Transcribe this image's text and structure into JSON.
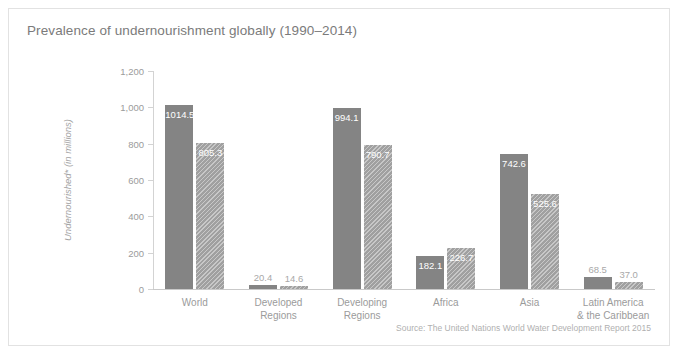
{
  "chart_data": {
    "type": "bar",
    "title": "Prevalence of undernourishment globally (1990–2014)",
    "xlabel": "",
    "ylabel": "Undernourished* (in millions)",
    "ylim": [
      0,
      1200
    ],
    "yticks": [
      "0",
      "200",
      "400",
      "600",
      "800",
      "1,000",
      "1,200"
    ],
    "grid": false,
    "legend": "none",
    "categories": [
      "World",
      "Developed Regions",
      "Developing Regions",
      "Africa",
      "Asia",
      "Latin America & the Caribbean"
    ],
    "category_lines": [
      [
        "World"
      ],
      [
        "Developed",
        "Regions"
      ],
      [
        "Developing",
        "Regions"
      ],
      [
        "Africa"
      ],
      [
        "Asia"
      ],
      [
        "Latin America",
        "& the Caribbean"
      ]
    ],
    "series": [
      {
        "name": "1990",
        "values": [
          1014.5,
          20.4,
          994.1,
          182.1,
          742.6,
          68.5
        ],
        "labels": [
          "1014.5",
          "20.4",
          "994.1",
          "182.1",
          "742.6",
          "68.5"
        ],
        "color": "#848484",
        "pattern": "solid"
      },
      {
        "name": "2014",
        "values": [
          805.3,
          14.6,
          790.7,
          226.7,
          525.6,
          37.0
        ],
        "labels": [
          "805.3",
          "14.6",
          "790.7",
          "226.7",
          "525.6",
          "37.0"
        ],
        "color": "#a0a0a0",
        "pattern": "diagonal-hatch"
      }
    ],
    "source": "Source: The United Nations World Water Development Report 2015"
  }
}
